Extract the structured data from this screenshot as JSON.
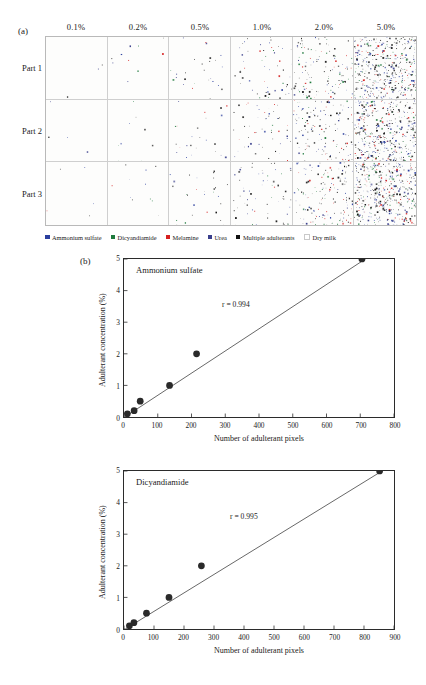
{
  "figure": {
    "panel_a": {
      "letter": "(a)",
      "column_headers": [
        "0.1%",
        "0.2%",
        "0.5%",
        "1.0%",
        "2.0%",
        "5.0%"
      ],
      "row_labels": [
        "Part 1",
        "Part 2",
        "Part 3"
      ],
      "cell_density": [
        [
          3,
          10,
          26,
          55,
          130,
          420
        ],
        [
          4,
          9,
          24,
          52,
          140,
          430
        ],
        [
          5,
          11,
          28,
          60,
          150,
          445
        ]
      ],
      "legend": [
        {
          "label": "Ammonium sulfate",
          "color": "#2b3f9e"
        },
        {
          "label": "Dicyandiamide",
          "color": "#1f7a3d"
        },
        {
          "label": "Melamine",
          "color": "#d62020"
        },
        {
          "label": "Urea",
          "color": "#3a3f8c"
        },
        {
          "label": "Multiple adulterants",
          "color": "#111111"
        },
        {
          "label": "Dry milk",
          "color": "#ffffff"
        }
      ]
    },
    "panel_b": {
      "letter": "(b)"
    }
  },
  "chart_data": [
    {
      "type": "scatter",
      "title": "Ammonium sulfate",
      "xlabel": "Number of adulterant pixels",
      "ylabel": "Adulterant concentration (%)",
      "annotation": "r = 0.994",
      "correlation": 0.994,
      "xlim": [
        0,
        800
      ],
      "ylim": [
        0,
        5
      ],
      "xticks": [
        0,
        100,
        200,
        300,
        400,
        500,
        600,
        700,
        800
      ],
      "yticks": [
        0,
        1,
        2,
        3,
        4,
        5
      ],
      "grid": false,
      "legend_position": "none",
      "x": [
        10,
        30,
        48,
        135,
        215,
        705
      ],
      "y": [
        0.1,
        0.2,
        0.5,
        1.0,
        2.0,
        5.0
      ],
      "fit_line": {
        "x": [
          5,
          715
        ],
        "y": [
          0.02,
          5.0
        ]
      }
    },
    {
      "type": "scatter",
      "title": "Dicyandiamide",
      "xlabel": "Number of adulterant pixels",
      "ylabel": "Adulterant concentration (%)",
      "annotation": "r = 0.995",
      "correlation": 0.995,
      "xlim": [
        0,
        900
      ],
      "ylim": [
        0,
        5
      ],
      "xticks": [
        0,
        100,
        200,
        300,
        400,
        500,
        600,
        700,
        800,
        900
      ],
      "yticks": [
        0,
        1,
        2,
        3,
        4,
        5
      ],
      "grid": false,
      "legend_position": "none",
      "x": [
        18,
        33,
        75,
        150,
        258,
        852
      ],
      "y": [
        0.1,
        0.2,
        0.5,
        1.0,
        2.0,
        5.0
      ],
      "fit_line": {
        "x": [
          8,
          860
        ],
        "y": [
          0.02,
          5.0
        ]
      }
    }
  ]
}
